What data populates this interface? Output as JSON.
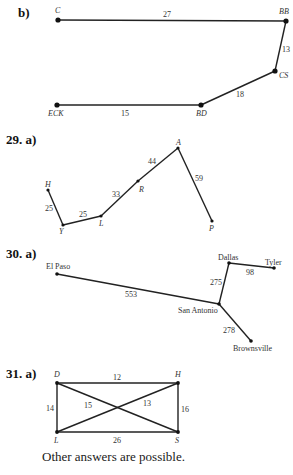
{
  "problems": [
    {
      "label": "b)",
      "vertices": [
        {
          "id": "C",
          "x": 58,
          "y": 20
        },
        {
          "id": "BB",
          "x": 286,
          "y": 21
        },
        {
          "id": "CS",
          "x": 275,
          "y": 71
        },
        {
          "id": "BD",
          "x": 201,
          "y": 105
        },
        {
          "id": "ECK",
          "x": 57,
          "y": 105
        }
      ],
      "edges": [
        {
          "from": "C",
          "to": "BB",
          "weight": "27"
        },
        {
          "from": "BB",
          "to": "CS",
          "weight": "13"
        },
        {
          "from": "CS",
          "to": "BD",
          "weight": "18"
        },
        {
          "from": "BD",
          "to": "ECK",
          "weight": "15"
        }
      ]
    },
    {
      "label": "29. a)",
      "vertices": [
        {
          "id": "H",
          "x": 48,
          "y": 190
        },
        {
          "id": "Y",
          "x": 63,
          "y": 225
        },
        {
          "id": "L",
          "x": 101,
          "y": 216
        },
        {
          "id": "R",
          "x": 138,
          "y": 181
        },
        {
          "id": "A",
          "x": 178,
          "y": 148
        },
        {
          "id": "P",
          "x": 212,
          "y": 221
        }
      ],
      "edges": [
        {
          "from": "H",
          "to": "Y",
          "weight": "25"
        },
        {
          "from": "Y",
          "to": "L",
          "weight": "25"
        },
        {
          "from": "L",
          "to": "R",
          "weight": "33"
        },
        {
          "from": "R",
          "to": "A",
          "weight": "44"
        },
        {
          "from": "A",
          "to": "P",
          "weight": "59"
        }
      ]
    },
    {
      "label": "30. a)",
      "vertices": [
        {
          "id": "El Paso",
          "x": 57,
          "y": 274
        },
        {
          "id": "San Antonio",
          "x": 219,
          "y": 304
        },
        {
          "id": "Dallas",
          "x": 229,
          "y": 263
        },
        {
          "id": "Tyler",
          "x": 274,
          "y": 268
        },
        {
          "id": "Brownsville",
          "x": 251,
          "y": 341
        }
      ],
      "edges": [
        {
          "from": "El Paso",
          "to": "San Antonio",
          "weight": "553"
        },
        {
          "from": "San Antonio",
          "to": "Dallas",
          "weight": "275"
        },
        {
          "from": "Dallas",
          "to": "Tyler",
          "weight": "98"
        },
        {
          "from": "San Antonio",
          "to": "Brownsville",
          "weight": "278"
        }
      ]
    },
    {
      "label": "31. a)",
      "vertices": [
        {
          "id": "D",
          "x": 57,
          "y": 383
        },
        {
          "id": "H",
          "x": 178,
          "y": 383
        },
        {
          "id": "L",
          "x": 57,
          "y": 432
        },
        {
          "id": "S",
          "x": 178,
          "y": 432
        }
      ],
      "edges": [
        {
          "from": "D",
          "to": "H",
          "weight": "12"
        },
        {
          "from": "D",
          "to": "L",
          "weight": "14"
        },
        {
          "from": "H",
          "to": "S",
          "weight": "16"
        },
        {
          "from": "L",
          "to": "S",
          "weight": "26"
        },
        {
          "from": "D",
          "to": "S",
          "weight": "15"
        },
        {
          "from": "L",
          "to": "H",
          "weight": "13"
        }
      ]
    }
  ],
  "footer_note": "Other answers are possible."
}
